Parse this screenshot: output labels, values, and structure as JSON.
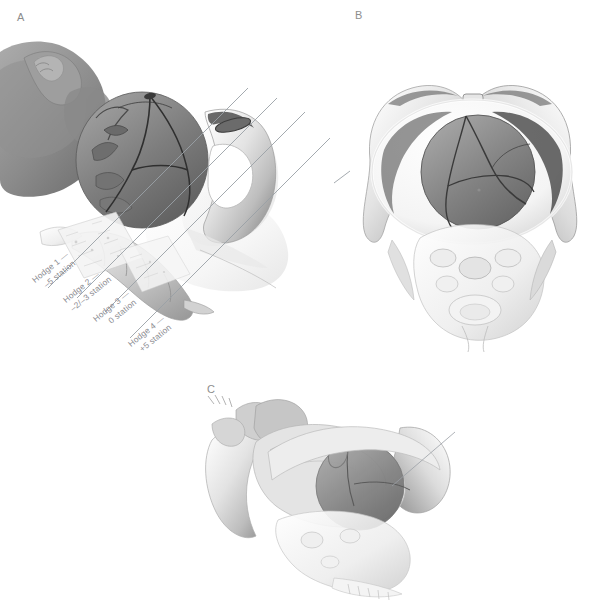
{
  "figure": {
    "background": "#ffffff",
    "line_color": "#9aa0a6",
    "label_color": "#8a8a90",
    "bone_light": "#f2f2f2",
    "bone_mid": "#cfcfcf",
    "bone_dark": "#8e8e8e",
    "head_dark": "#6f6f6f",
    "head_mid": "#8a8a8a"
  },
  "panels": [
    {
      "id": "A",
      "letter": "A",
      "view": "lateral-sagittal-pelvis-fetus"
    },
    {
      "id": "B",
      "letter": "B",
      "view": "anterior-pelvic-inlet-fetal-head"
    },
    {
      "id": "C",
      "letter": "C",
      "view": "oblique-pelvis-fetus"
    }
  ],
  "hodge_planes": [
    {
      "index": 1,
      "line1": "Hodge 1 —",
      "line2": "–5 station"
    },
    {
      "index": 2,
      "line1": "Hodge 2 —",
      "line2": "–2/–3 station"
    },
    {
      "index": 3,
      "line1": "Hodge 3 —",
      "line2": "0 station"
    },
    {
      "index": 4,
      "line1": "Hodge 4 —",
      "line2": "+5 station"
    }
  ]
}
